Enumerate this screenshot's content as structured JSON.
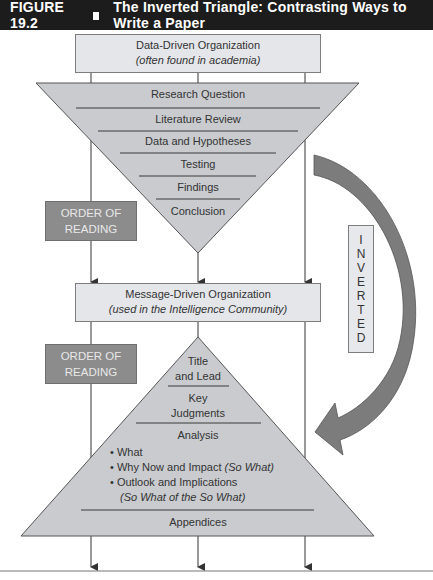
{
  "figure": {
    "label": "FIGURE 19.2",
    "title": "The Inverted Triangle: Contrasting Ways to Write a Paper"
  },
  "data_driven": {
    "title": "Data-Driven Organization",
    "subtitle": "(often found in academia)",
    "levels": [
      "Research Question",
      "Literature Review",
      "Data and Hypotheses",
      "Testing",
      "Findings",
      "Conclusion"
    ]
  },
  "message_driven": {
    "title": "Message-Driven Organization",
    "subtitle": "(used in the Intelligence Community)",
    "levels": {
      "title_lead_1": "Title",
      "title_lead_2": "and Lead",
      "key_1": "Key",
      "key_2": "Judgments",
      "analysis": "Analysis",
      "bullets": [
        {
          "text": "What",
          "note": ""
        },
        {
          "text": "Why Now and Impact ",
          "note": "(So What)"
        },
        {
          "text": "Outlook and Implications",
          "note": "(So What of the So What)"
        }
      ],
      "appendices": "Appendices"
    }
  },
  "order_of_reading": {
    "line1": "ORDER OF",
    "line2": "READING"
  },
  "inverted": {
    "letters": [
      "I",
      "N",
      "V",
      "E",
      "R",
      "T",
      "E",
      "D"
    ]
  },
  "colors": {
    "header_bg": "#1c1c1c",
    "triangle_fill": "#c9cbcf",
    "box_fill": "#e4e6ea",
    "order_fill": "#8c8c8c",
    "arrow_fill": "#7c7c7c",
    "line": "#555555"
  }
}
